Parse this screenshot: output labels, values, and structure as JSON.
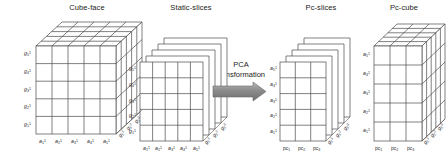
{
  "figure": {
    "caption_absent": true,
    "background_color": "#ffffff",
    "line_color": "#444444",
    "arrow_color": "#808080"
  },
  "panels": [
    {
      "id": "cube-face",
      "title": "Cube-face",
      "shape": "3d-cube",
      "rows": 5,
      "cols": 5,
      "depth_slices": 5
    },
    {
      "id": "static-slices",
      "title": "Static-slices",
      "shape": "stacked-slices",
      "rows": 5,
      "cols": 5,
      "depth_slices": 5
    },
    {
      "id": "pc-slices",
      "title": "Pc-slices",
      "shape": "stacked-slices",
      "rows": 5,
      "cols": 3,
      "depth_slices": 5
    },
    {
      "id": "pc-cube",
      "title": "Pc-cube",
      "shape": "3d-cube",
      "rows": 5,
      "cols": 3,
      "depth_slices": 5
    }
  ],
  "transformation": {
    "line1": "PCA",
    "line2": "transformation",
    "arrow_direction": "right"
  },
  "axes": {
    "cube_face_y": [
      "g",
      "g",
      "g",
      "g",
      "g"
    ],
    "cube_face_y_sub": [
      "1",
      "2",
      "3",
      "4",
      "5"
    ],
    "cube_face_y_sup": [
      "1",
      "1",
      "1",
      "1",
      "1"
    ],
    "cube_face_x": [
      "a",
      "a",
      "a",
      "a",
      "a"
    ],
    "cube_face_x_sub": [
      "1",
      "2",
      "3",
      "4",
      "5"
    ],
    "cube_face_x_sup": [
      "1",
      "1",
      "1",
      "1",
      "1"
    ],
    "cube_face_depth": [
      "g",
      "g",
      "g"
    ],
    "cube_face_depth_sub": [
      "1",
      "2",
      "3"
    ],
    "cube_face_depth_sup": [
      "1",
      "2",
      "3"
    ],
    "static_y": [
      "g",
      "g",
      "g",
      "g",
      "g"
    ],
    "static_y_sub": [
      "1",
      "2",
      "3",
      "4",
      "5"
    ],
    "static_y_sup": [
      "1",
      "1",
      "1",
      "1",
      "1"
    ],
    "static_x": [
      "a",
      "a",
      "a",
      "a",
      "a"
    ],
    "static_x_sub": [
      "1",
      "2",
      "3",
      "4",
      "5"
    ],
    "static_x_sup": [
      "1",
      "1",
      "1",
      "1",
      "1"
    ],
    "static_depth": [
      "g",
      "g",
      "g"
    ],
    "static_depth_sub": [
      "1",
      "2",
      "3"
    ],
    "static_depth_sup": [
      "1",
      "2",
      "3"
    ],
    "pc_y": [
      "a",
      "a",
      "a",
      "a",
      "a"
    ],
    "pc_y_sub": [
      "1",
      "2",
      "3",
      "4",
      "5"
    ],
    "pc_y_sup": [
      "1",
      "1",
      "1",
      "1",
      "1"
    ],
    "pc_x": [
      "pc",
      "pc",
      "pc"
    ],
    "pc_x_sub": [
      "1",
      "2",
      "3"
    ],
    "pc_depth": [
      "g",
      "g",
      "g"
    ],
    "pc_depth_sub": [
      "1",
      "2",
      "3"
    ],
    "pc_depth_sup": [
      "1",
      "2",
      "3"
    ]
  },
  "labels": {
    "cube_face_y": [
      {
        "base": "g",
        "sub": "5",
        "sup": "1"
      },
      {
        "base": "g",
        "sub": "4",
        "sup": "1"
      },
      {
        "base": "g",
        "sub": "3",
        "sup": "1"
      },
      {
        "base": "g",
        "sub": "2",
        "sup": "1"
      },
      {
        "base": "g",
        "sub": "1",
        "sup": "1"
      }
    ],
    "cube_face_x": [
      {
        "base": "a",
        "sub": "1",
        "sup": "1"
      },
      {
        "base": "a",
        "sub": "2",
        "sup": "1"
      },
      {
        "base": "a",
        "sub": "3",
        "sup": "1"
      },
      {
        "base": "a",
        "sub": "4",
        "sup": "1"
      },
      {
        "base": "a",
        "sub": "5",
        "sup": "1"
      }
    ],
    "cube_face_depth": [
      {
        "base": "g",
        "sub": "1",
        "sup": "1"
      },
      {
        "base": "g",
        "sub": "1",
        "sup": "2"
      },
      {
        "base": "g",
        "sub": "1",
        "sup": "3"
      }
    ],
    "static_y": [
      {
        "base": "g",
        "sub": "5",
        "sup": "1"
      },
      {
        "base": "g",
        "sub": "4",
        "sup": "1"
      },
      {
        "base": "g",
        "sub": "3",
        "sup": "1"
      },
      {
        "base": "g",
        "sub": "2",
        "sup": "1"
      },
      {
        "base": "g",
        "sub": "1",
        "sup": "1"
      }
    ],
    "static_x": [
      {
        "base": "a",
        "sub": "1",
        "sup": "1"
      },
      {
        "base": "a",
        "sub": "2",
        "sup": "1"
      },
      {
        "base": "a",
        "sub": "3",
        "sup": "1"
      },
      {
        "base": "a",
        "sub": "4",
        "sup": "1"
      },
      {
        "base": "a",
        "sub": "5",
        "sup": "1"
      }
    ],
    "static_depth": [
      {
        "base": "g",
        "sub": "1",
        "sup": "1"
      },
      {
        "base": "g",
        "sub": "1",
        "sup": "2"
      },
      {
        "base": "g",
        "sub": "1",
        "sup": "3"
      }
    ],
    "pcslices_y": [
      {
        "base": "a",
        "sub": "5",
        "sup": "1"
      },
      {
        "base": "a",
        "sub": "4",
        "sup": "1"
      },
      {
        "base": "a",
        "sub": "3",
        "sup": "1"
      },
      {
        "base": "a",
        "sub": "2",
        "sup": "1"
      },
      {
        "base": "a",
        "sub": "1",
        "sup": "1"
      }
    ],
    "pcslices_x": [
      {
        "base": "pc",
        "sub": "1"
      },
      {
        "base": "pc",
        "sub": "2"
      },
      {
        "base": "pc",
        "sub": "3"
      }
    ],
    "pcslices_depth": [
      {
        "base": "g",
        "sub": "1",
        "sup": "1"
      },
      {
        "base": "g",
        "sub": "1",
        "sup": "2"
      },
      {
        "base": "g",
        "sub": "1",
        "sup": "3"
      }
    ],
    "pccube_y": [
      {
        "base": "a",
        "sub": "5",
        "sup": "1"
      },
      {
        "base": "a",
        "sub": "4",
        "sup": "1"
      },
      {
        "base": "a",
        "sub": "3",
        "sup": "1"
      },
      {
        "base": "a",
        "sub": "2",
        "sup": "1"
      },
      {
        "base": "a",
        "sub": "1",
        "sup": "1"
      }
    ],
    "pccube_x": [
      {
        "base": "pc",
        "sub": "1"
      },
      {
        "base": "pc",
        "sub": "2"
      },
      {
        "base": "pc",
        "sub": "3"
      }
    ],
    "pccube_depth": [
      {
        "base": "g",
        "sub": "1",
        "sup": "1"
      },
      {
        "base": "g",
        "sub": "1",
        "sup": "2"
      },
      {
        "base": "g",
        "sub": "1",
        "sup": "3"
      }
    ]
  }
}
